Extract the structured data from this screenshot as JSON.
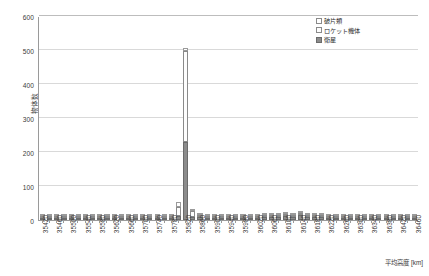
{
  "chart_data": {
    "type": "bar",
    "title": "",
    "xlabel": "平均高度 [km]",
    "ylabel": "物体数",
    "ylim": [
      0,
      600
    ],
    "ytick_values": [
      0,
      100,
      200,
      300,
      400,
      500,
      600
    ],
    "grid": true,
    "stacked": true,
    "legend_position": "top-right",
    "categories": [
      "35420",
      "35440",
      "35460",
      "35480",
      "35500",
      "35520",
      "35540",
      "35560",
      "35580",
      "35600",
      "35620",
      "35640",
      "35660",
      "35680",
      "35700",
      "35720",
      "35740",
      "35760",
      "35780",
      "35800",
      "35820",
      "35840",
      "35860",
      "35880",
      "35900",
      "35920",
      "35940",
      "35960",
      "35980",
      "36000",
      "36020",
      "36040",
      "36060",
      "36080",
      "36100",
      "36120",
      "36140",
      "36160",
      "36180",
      "36200",
      "36220",
      "36240",
      "36260",
      "36280",
      "36300",
      "36320",
      "36340",
      "36360",
      "36380",
      "36400",
      "36420",
      "36440",
      "36460"
    ],
    "xtick_labels": [
      "35420",
      "",
      "35460",
      "",
      "35500",
      "",
      "35540",
      "",
      "35580",
      "",
      "35620",
      "",
      "35660",
      "",
      "35700",
      "",
      "35740",
      "",
      "35780",
      "",
      "35820",
      "",
      "35860",
      "",
      "35900",
      "",
      "35940",
      "",
      "35980",
      "",
      "36020",
      "",
      "36060",
      "",
      "36100",
      "",
      "36140",
      "",
      "36180",
      "",
      "36220",
      "",
      "36260",
      "",
      "36300",
      "",
      "36340",
      "",
      "36380",
      "",
      "36420",
      "",
      "36460"
    ],
    "series": [
      {
        "name": "衛星",
        "color": "#8c8c8c",
        "values": [
          3,
          2,
          3,
          2,
          2,
          2,
          2,
          3,
          2,
          2,
          2,
          3,
          3,
          2,
          2,
          3,
          3,
          4,
          6,
          13,
          228,
          10,
          9,
          6,
          7,
          6,
          7,
          7,
          7,
          6,
          7,
          8,
          9,
          9,
          11,
          9,
          14,
          9,
          9,
          8,
          7,
          6,
          6,
          5,
          4,
          4,
          3,
          3,
          2,
          2,
          2,
          2,
          2
        ]
      },
      {
        "name": "ロケット機体",
        "color": "#fdfdfd",
        "values": [
          1,
          1,
          1,
          1,
          1,
          1,
          1,
          1,
          1,
          1,
          1,
          1,
          1,
          1,
          1,
          1,
          2,
          2,
          4,
          26,
          270,
          16,
          6,
          2,
          2,
          2,
          2,
          2,
          2,
          2,
          2,
          2,
          2,
          2,
          2,
          2,
          2,
          2,
          2,
          2,
          2,
          1,
          1,
          1,
          1,
          1,
          1,
          1,
          1,
          1,
          1,
          1,
          1
        ]
      },
      {
        "name": "破片類",
        "color": "#ffffff",
        "values": [
          1,
          1,
          1,
          1,
          1,
          1,
          1,
          1,
          1,
          1,
          1,
          1,
          1,
          1,
          1,
          1,
          1,
          2,
          5,
          13,
          7,
          4,
          3,
          2,
          1,
          1,
          1,
          1,
          1,
          1,
          1,
          1,
          1,
          1,
          1,
          1,
          1,
          1,
          1,
          1,
          1,
          1,
          1,
          1,
          1,
          1,
          1,
          1,
          1,
          1,
          1,
          1,
          1
        ]
      }
    ],
    "annotations": {
      "peak_category": "35820",
      "peak_total": 505
    }
  },
  "legend": {
    "items": [
      {
        "label": "破片類",
        "key": "debris"
      },
      {
        "label": "ロケット機体",
        "key": "rocket"
      },
      {
        "label": "衛星",
        "key": "sat"
      }
    ]
  }
}
